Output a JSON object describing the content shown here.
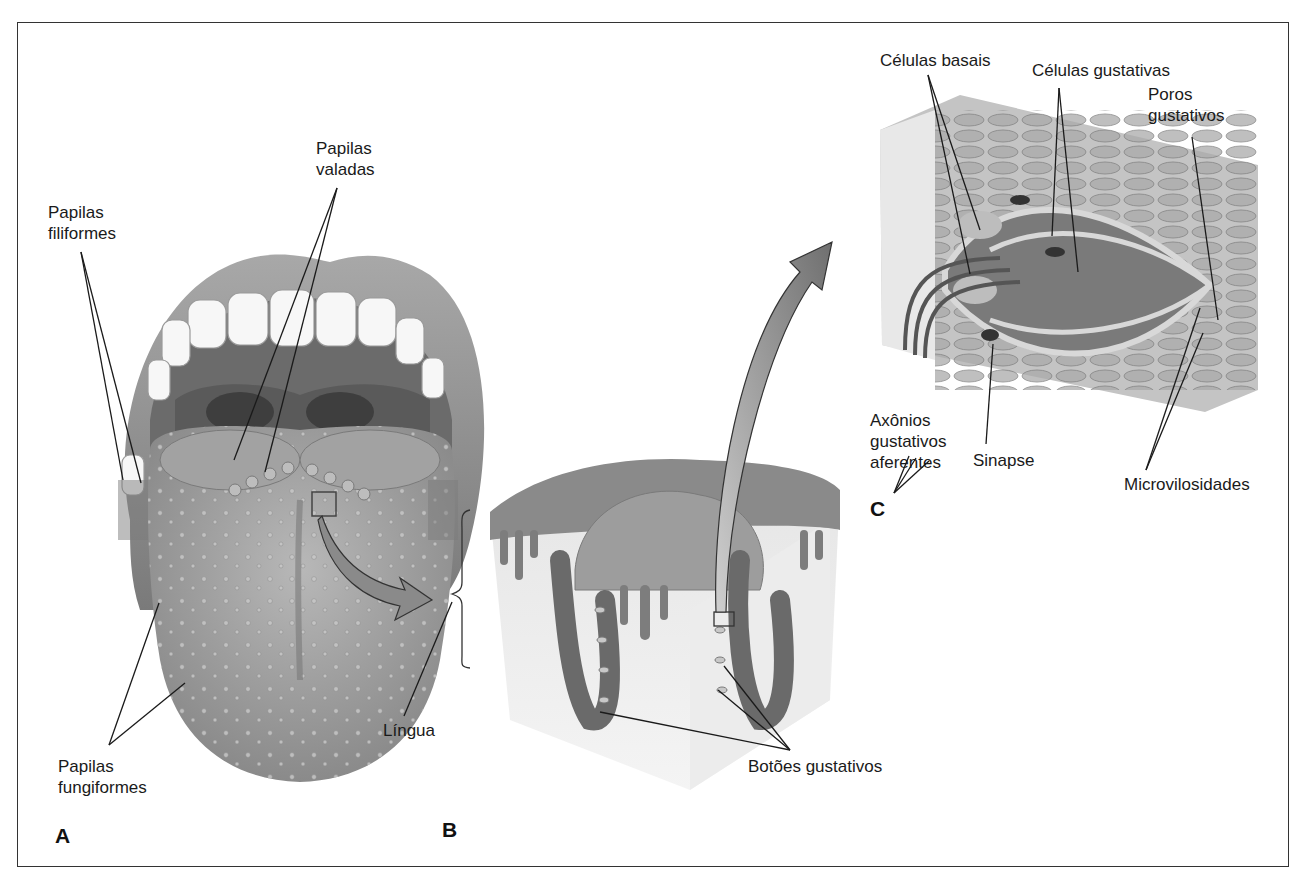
{
  "figure": {
    "panels": [
      {
        "id": "A",
        "label": "A"
      },
      {
        "id": "B",
        "label": "B"
      },
      {
        "id": "C",
        "label": "C"
      }
    ],
    "labels": {
      "papilas_filiformes": {
        "line1": "Papilas",
        "line2": "filiformes"
      },
      "papilas_valadas": {
        "line1": "Papilas",
        "line2": "valadas"
      },
      "papilas_fungiformes": {
        "line1": "Papilas",
        "line2": "fungiformes"
      },
      "lingua": "Língua",
      "botoes_gustativos": "Botões gustativos",
      "celulas_basais": "Células basais",
      "celulas_gustativas": "Células gustativas",
      "poros_gustativos": {
        "line1": "Poros",
        "line2": "gustativos"
      },
      "axonios": {
        "line1": "Axônios",
        "line2": "gustativos",
        "line3": "aferentes"
      },
      "sinapse": "Sinapse",
      "microvilosidades": "Microvilosidades"
    },
    "colors": {
      "border": "#333333",
      "tissue_dark": "#6e6e6e",
      "tissue_mid": "#9a9a9a",
      "tissue_light": "#d6d6d6",
      "arrow": "#8c8c8c"
    }
  }
}
